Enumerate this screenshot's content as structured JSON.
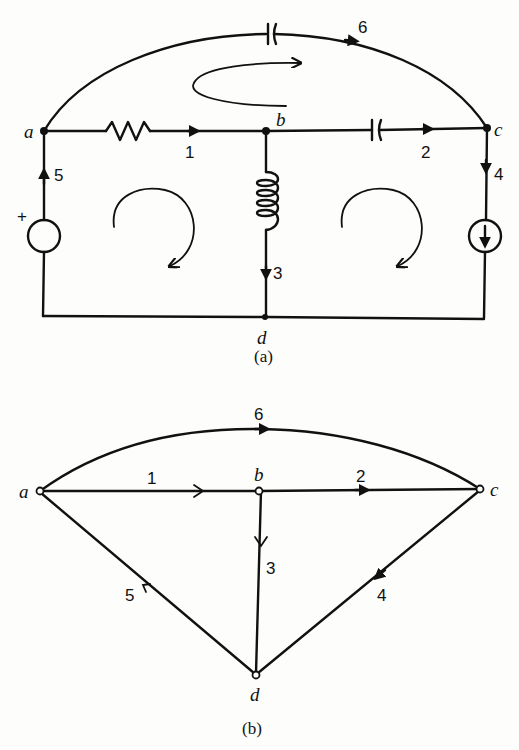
{
  "figure_a": {
    "caption": "(a)",
    "nodes": [
      {
        "id": "a",
        "label": "a"
      },
      {
        "id": "b",
        "label": "b"
      },
      {
        "id": "c",
        "label": "c"
      },
      {
        "id": "d",
        "label": "d"
      }
    ],
    "branches": [
      {
        "id": 1,
        "label": "1",
        "from": "a",
        "to": "b",
        "element": "resistor"
      },
      {
        "id": 2,
        "label": "2",
        "from": "b",
        "to": "c",
        "element": "capacitor"
      },
      {
        "id": 3,
        "label": "3",
        "from": "b",
        "to": "d",
        "element": "inductor"
      },
      {
        "id": 4,
        "label": "4",
        "from": "c",
        "to": "d",
        "element": "current-source"
      },
      {
        "id": 5,
        "label": "5",
        "from": "d",
        "to": "a",
        "element": "voltage-source"
      },
      {
        "id": 6,
        "label": "6",
        "from": "a",
        "to": "c",
        "element": "capacitor"
      }
    ],
    "source_polarity": "+",
    "loop_directions": [
      "clockwise",
      "clockwise",
      "clockwise"
    ]
  },
  "figure_b": {
    "caption": "(b)",
    "nodes": [
      {
        "id": "a",
        "label": "a"
      },
      {
        "id": "b",
        "label": "b"
      },
      {
        "id": "c",
        "label": "c"
      },
      {
        "id": "d",
        "label": "d"
      }
    ],
    "edges": [
      {
        "id": 1,
        "label": "1",
        "from": "a",
        "to": "b"
      },
      {
        "id": 2,
        "label": "2",
        "from": "b",
        "to": "c"
      },
      {
        "id": 3,
        "label": "3",
        "from": "b",
        "to": "d"
      },
      {
        "id": 4,
        "label": "4",
        "from": "c",
        "to": "d"
      },
      {
        "id": 5,
        "label": "5",
        "from": "d",
        "to": "a"
      },
      {
        "id": 6,
        "label": "6",
        "from": "a",
        "to": "c"
      }
    ]
  }
}
